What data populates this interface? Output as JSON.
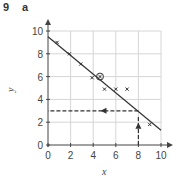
{
  "question": {
    "number": "9",
    "part": "a"
  },
  "chart_data": {
    "type": "scatter",
    "title": "",
    "xlabel": "x",
    "ylabel": "y",
    "xlim": [
      0,
      10
    ],
    "ylim": [
      0,
      10
    ],
    "xticks": [
      0,
      2,
      4,
      6,
      8,
      10
    ],
    "yticks": [
      0,
      2,
      4,
      6,
      8,
      10
    ],
    "grid": true,
    "series": [
      {
        "name": "data points",
        "marker": "x",
        "points": [
          {
            "x": 0.8,
            "y": 9.0
          },
          {
            "x": 1.9,
            "y": 8.0
          },
          {
            "x": 2.9,
            "y": 7.1
          },
          {
            "x": 3.9,
            "y": 5.9
          },
          {
            "x": 5.0,
            "y": 4.9
          },
          {
            "x": 6.0,
            "y": 4.9
          },
          {
            "x": 7.0,
            "y": 4.9
          },
          {
            "x": 9.0,
            "y": 1.8
          }
        ]
      },
      {
        "name": "mean point",
        "marker": "circled-x",
        "points": [
          {
            "x": 4.6,
            "y": 6.0
          }
        ]
      }
    ],
    "line_of_best_fit": {
      "x1": 0,
      "y1": 9.5,
      "x2": 10,
      "y2": 1.3
    },
    "annotations": [
      {
        "type": "dashed-arrow-up",
        "x": 8,
        "from_y": 0,
        "to_y": 3
      },
      {
        "type": "dashed-arrow-left",
        "y": 3,
        "from_x": 8,
        "to_x": 0
      }
    ]
  }
}
